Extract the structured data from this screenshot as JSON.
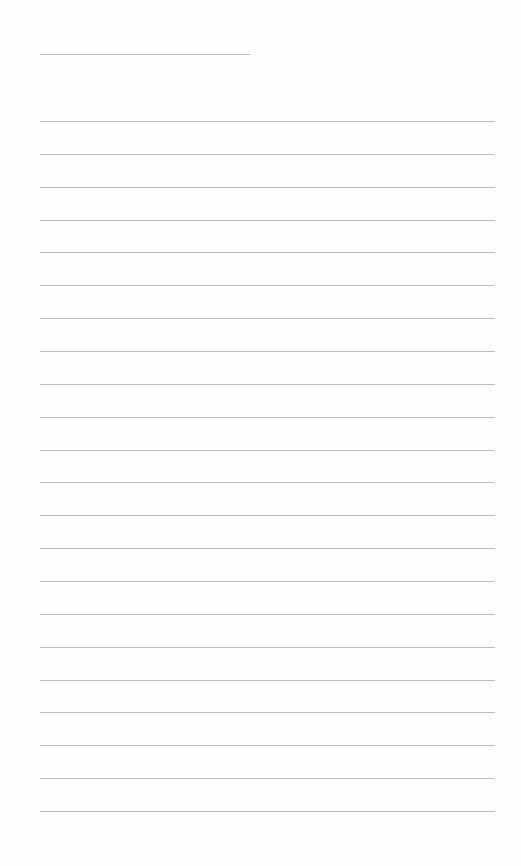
{
  "page": {
    "type": "blank-lined-sheet",
    "title_line": {
      "text": ""
    },
    "line_color": "#bcbcbc",
    "background_color": "#ffffff",
    "line_count": 22,
    "lines": [
      "",
      "",
      "",
      "",
      "",
      "",
      "",
      "",
      "",
      "",
      "",
      "",
      "",
      "",
      "",
      "",
      "",
      "",
      "",
      "",
      "",
      ""
    ]
  }
}
